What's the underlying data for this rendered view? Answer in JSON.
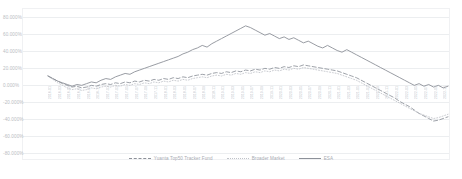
{
  "chart_data": {
    "type": "line",
    "title": "",
    "xlabel": "",
    "ylabel": "",
    "ylim": [
      -80,
      80
    ],
    "ytick_labels": [
      "80.000%",
      "60.000%",
      "40.000%",
      "20.000%",
      "0.000%",
      "-20.000%",
      "-40.000%",
      "-60.000%",
      "-80.000%"
    ],
    "ytick_values": [
      80,
      60,
      40,
      20,
      0,
      -20,
      -40,
      -60,
      -80
    ],
    "grid": true,
    "legend_position": "bottom-center",
    "line_color": "#8d9199",
    "grid_color": "#eceef0",
    "x": [
      "2016-01",
      "2016-02",
      "2016-03",
      "2016-04",
      "2016-05",
      "2016-06",
      "2016-07",
      "2016-08",
      "2016-09",
      "2016-10",
      "2016-11",
      "2016-12",
      "2017-01",
      "2017-02",
      "2017-03",
      "2017-04",
      "2017-05",
      "2017-06",
      "2017-07",
      "2017-08",
      "2017-09",
      "2017-10",
      "2017-11",
      "2017-12",
      "2018-01",
      "2018-02",
      "2018-03",
      "2018-04",
      "2018-05",
      "2018-06",
      "2018-07",
      "2018-08",
      "2018-09",
      "2018-10",
      "2018-11",
      "2018-12",
      "2019-01",
      "2019-02",
      "2019-03",
      "2019-04",
      "2019-05",
      "2019-06",
      "2019-07",
      "2019-08",
      "2019-09",
      "2019-10",
      "2019-11",
      "2019-12",
      "2020-01",
      "2020-02",
      "2020-03",
      "2020-04",
      "2020-05",
      "2020-06",
      "2020-07",
      "2020-08",
      "2020-09",
      "2020-10",
      "2020-11",
      "2020-12",
      "2021-01",
      "2021-02",
      "2021-03",
      "2021-04",
      "2021-05",
      "2021-06",
      "2021-07",
      "2021-08",
      "2021-09",
      "2021-10",
      "2021-11",
      "2021-12",
      "2022-01",
      "2022-02",
      "2022-03",
      "2022-04",
      "2022-05",
      "2022-06",
      "2022-07",
      "2022-08",
      "2022-09",
      "2022-10",
      "2022-11",
      "2022-12"
    ],
    "series": [
      {
        "name": "Yuanta Top50 Tracker Fund",
        "style": "dashed",
        "values": [
          0,
          -3,
          -6,
          -9,
          -11,
          -13,
          -12,
          -14,
          -13,
          -11,
          -12,
          -10,
          -9,
          -10,
          -8,
          -9,
          -7,
          -8,
          -6,
          -7,
          -5,
          -6,
          -4,
          -5,
          -3,
          -4,
          -2,
          -3,
          -1,
          -2,
          0,
          1,
          2,
          1,
          3,
          4,
          3,
          5,
          4,
          6,
          5,
          7,
          6,
          8,
          7,
          9,
          8,
          10,
          9,
          11,
          10,
          12,
          11,
          13,
          12,
          11,
          10,
          9,
          8,
          7,
          6,
          4,
          2,
          0,
          -2,
          -5,
          -8,
          -11,
          -14,
          -17,
          -20,
          -23,
          -26,
          -30,
          -33,
          -36,
          -40,
          -44,
          -47,
          -50,
          -53,
          -52,
          -50,
          -48
        ]
      },
      {
        "name": "Broader Market",
        "style": "dotted",
        "values": [
          0,
          -4,
          -8,
          -11,
          -14,
          -16,
          -15,
          -17,
          -16,
          -14,
          -15,
          -13,
          -12,
          -13,
          -11,
          -12,
          -10,
          -11,
          -9,
          -10,
          -8,
          -9,
          -7,
          -8,
          -6,
          -7,
          -5,
          -6,
          -4,
          -5,
          -3,
          -2,
          -1,
          -2,
          0,
          1,
          0,
          2,
          1,
          3,
          2,
          4,
          3,
          5,
          4,
          6,
          5,
          7,
          6,
          8,
          7,
          9,
          8,
          10,
          9,
          8,
          7,
          6,
          5,
          4,
          3,
          1,
          -1,
          -3,
          -5,
          -8,
          -11,
          -14,
          -17,
          -20,
          -23,
          -26,
          -29,
          -32,
          -35,
          -38,
          -41,
          -44,
          -46,
          -48,
          -50,
          -49,
          -47,
          -45
        ]
      },
      {
        "name": "ESA",
        "style": "solid",
        "values": [
          0,
          -3,
          -6,
          -8,
          -10,
          -12,
          -10,
          -11,
          -9,
          -7,
          -8,
          -5,
          -3,
          -4,
          -1,
          1,
          3,
          2,
          5,
          7,
          9,
          11,
          13,
          15,
          17,
          19,
          21,
          23,
          26,
          28,
          31,
          33,
          36,
          34,
          38,
          41,
          44,
          47,
          50,
          53,
          56,
          59,
          57,
          54,
          51,
          48,
          50,
          47,
          44,
          46,
          43,
          45,
          42,
          39,
          41,
          38,
          35,
          33,
          36,
          33,
          30,
          28,
          31,
          28,
          25,
          22,
          19,
          16,
          13,
          10,
          7,
          4,
          1,
          -2,
          -5,
          -8,
          -11,
          -9,
          -12,
          -10,
          -13,
          -11,
          -14,
          -12
        ]
      }
    ]
  },
  "legend": {
    "items": [
      {
        "label": "Yuanta Top50 Tracker Fund",
        "style": "dashed"
      },
      {
        "label": "Broader Market",
        "style": "dotted"
      },
      {
        "label": "ESA",
        "style": "solid"
      }
    ]
  }
}
